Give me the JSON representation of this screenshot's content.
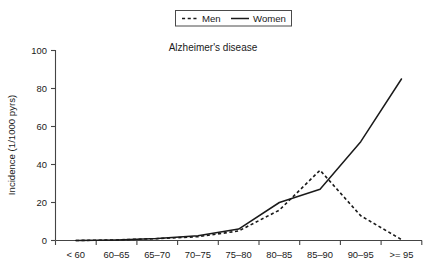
{
  "chart_data": {
    "type": "line",
    "title": "Alzheimer's disease",
    "xlabel": "",
    "ylabel": "Incidence (1/1000 pyrs)",
    "categories": [
      "< 60",
      "60–65",
      "65–70",
      "70–75",
      "75–80",
      "80–85",
      "85–90",
      "90–95",
      ">= 95"
    ],
    "series": [
      {
        "name": "Men",
        "style": "dashed",
        "values": [
          0,
          0.3,
          1,
          2,
          5,
          16,
          37,
          13,
          0.5
        ]
      },
      {
        "name": "Women",
        "style": "solid",
        "values": [
          0,
          0.3,
          1,
          2.5,
          6,
          20,
          27,
          52,
          85
        ]
      }
    ],
    "ylim": [
      0,
      100
    ],
    "yticks": [
      0,
      20,
      40,
      60,
      80,
      100
    ],
    "ytick_labels": [
      "0",
      "20",
      "40",
      "60",
      "80",
      "100"
    ],
    "grid": false,
    "legend_position": "top-center",
    "legend_entries": [
      "Men",
      "Women"
    ],
    "colors": {
      "men": "#1a1a1a",
      "women": "#1a1a1a",
      "axis": "#444444",
      "background": "#ffffff"
    }
  },
  "legend": {
    "men_label": "Men",
    "women_label": "Women"
  },
  "axes": {
    "y_title": "Incidence (1/1000 pyrs)",
    "y_labels": [
      "100",
      "80",
      "60",
      "40",
      "20",
      "0"
    ],
    "x_labels": [
      "< 60",
      "60–65",
      "65–70",
      "70–75",
      "75–80",
      "80–85",
      "85–90",
      "90–95",
      ">= 95"
    ]
  },
  "title": {
    "text": "Alzheimer's disease"
  }
}
